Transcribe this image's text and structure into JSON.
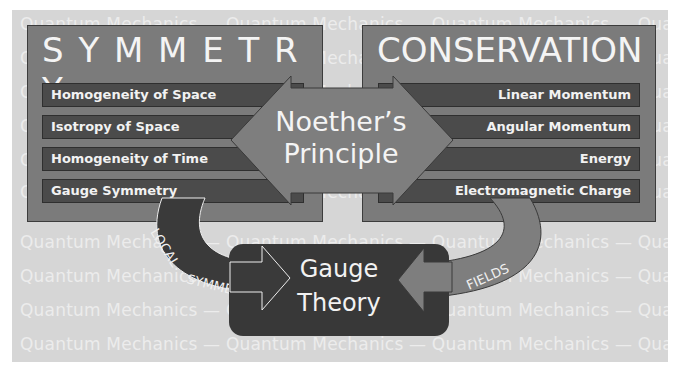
{
  "background": {
    "repeating_text": "Quantum  Mechanics  —  Quantum  Mechanics  —  Quantum  Mechanics  —  Quantum  Mechanics",
    "rows": 10,
    "color": "#d6d6d6"
  },
  "symmetry": {
    "title": "S Y M M E T R Y",
    "items": [
      {
        "label": "Homogeneity of Space"
      },
      {
        "label": "Isotropy of Space"
      },
      {
        "label": "Homogeneity of Time"
      },
      {
        "label": "Gauge Symmetry"
      }
    ]
  },
  "conservation": {
    "title": "CONSERVATION",
    "items": [
      {
        "label": "Linear Momentum"
      },
      {
        "label": "Angular Momentum"
      },
      {
        "label": "Energy"
      },
      {
        "label": "Electromagnetic Charge"
      }
    ]
  },
  "center": {
    "line1": "Noether’s",
    "line2": "Principle"
  },
  "bottom": {
    "line1": "Gauge",
    "line2": "Theory",
    "left_arrow_label": "LOCAL SYMMETRY",
    "right_arrow_label": "FIELDS"
  },
  "colors": {
    "panel": "#7b7b7b",
    "bar": "#4b4b4b",
    "dark_box": "#383838",
    "text": "#f4f4f4"
  }
}
